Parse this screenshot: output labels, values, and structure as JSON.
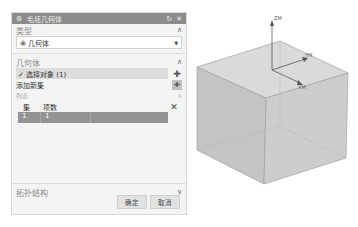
{
  "dialog": {
    "title": "毛坯几何体",
    "title_icon": "gear-icon",
    "reset_glyph": "↻",
    "close_glyph": "✕",
    "sections": {
      "type": {
        "label": "类型",
        "collapse_glyph": "∧",
        "select_value": "几何体",
        "select_icon": "geometry-body-icon",
        "caret": "▼"
      },
      "geometry": {
        "label": "几何体",
        "collapse_glyph": "∧",
        "select_object": "✓ 选择对象 (1)",
        "select_object_button_glyph": "✚",
        "add_set": "添加新集",
        "add_set_button_glyph": "✚",
        "list": {
          "label": "列表",
          "collapse_glyph": "∧",
          "columns": [
            "集",
            "项数"
          ],
          "remove_glyph": "✕",
          "rows": [
            {
              "set": "1",
              "count": "1"
            }
          ]
        }
      },
      "topology": {
        "label": "拓扑结构",
        "collapse_glyph": "∨"
      }
    },
    "buttons": {
      "ok": "确定",
      "cancel": "取消"
    }
  },
  "viewport": {
    "axes": {
      "z": "ZM",
      "y": "YM",
      "x": "XM"
    },
    "colors": {
      "cube_top": "#d9d9d9",
      "cube_left": "#c2c2c2",
      "cube_right": "#cbcbcb",
      "edge": "#9a9a9a"
    }
  }
}
